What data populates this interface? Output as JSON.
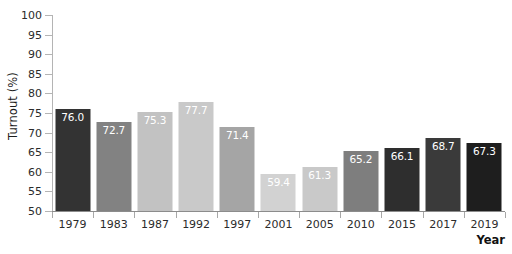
{
  "chart_data": {
    "type": "bar",
    "title": "",
    "xlabel": "Year",
    "ylabel": "Turnout (%)",
    "categories": [
      "1979",
      "1983",
      "1987",
      "1992",
      "1997",
      "2001",
      "2005",
      "2010",
      "2015",
      "2017",
      "2019"
    ],
    "values": [
      76.0,
      72.7,
      75.3,
      77.7,
      71.4,
      59.4,
      61.3,
      65.2,
      66.1,
      68.7,
      67.3
    ],
    "value_labels": [
      "76.0",
      "72.7",
      "75.3",
      "77.7",
      "71.4",
      "59.4",
      "61.3",
      "65.2",
      "66.1",
      "68.7",
      "67.3"
    ],
    "bar_colors": [
      "#333333",
      "#828282",
      "#c2c2c2",
      "#c9c9c9",
      "#a5a5a5",
      "#d2d2d2",
      "#c9c9c9",
      "#7e7e7e",
      "#2e2e2e",
      "#3a3a3a",
      "#1e1e1e"
    ],
    "ylim": [
      50,
      100
    ],
    "ytick_labels": [
      "100",
      "95",
      "90",
      "85",
      "80",
      "75",
      "70",
      "65",
      "60",
      "55",
      "50"
    ],
    "ytick_values": [
      100,
      95,
      90,
      85,
      80,
      75,
      70,
      65,
      60,
      55,
      50
    ],
    "grid": false,
    "legend": "none",
    "axis_color": "#b4b4b4",
    "value_label_color": "#ffffff",
    "background": "#ffffff"
  }
}
